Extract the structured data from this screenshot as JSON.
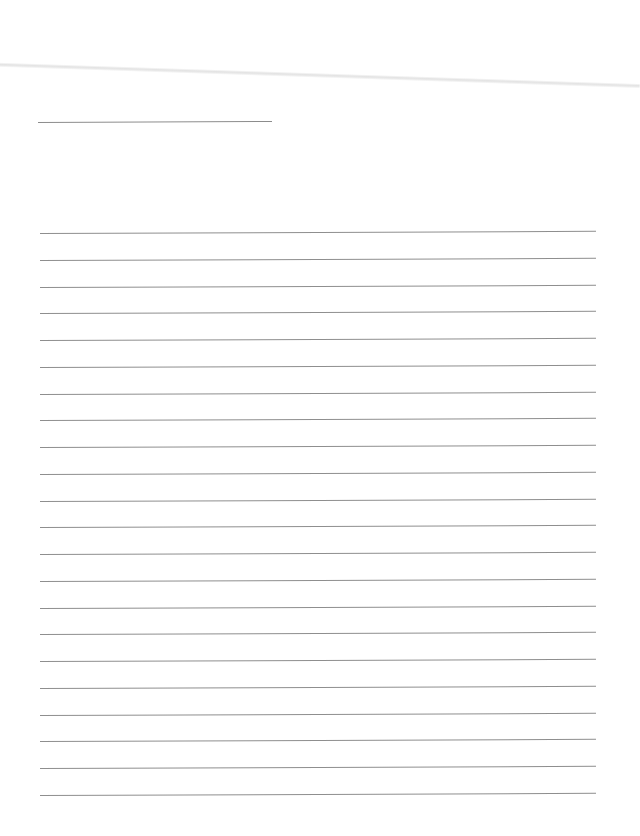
{
  "page": {
    "type": "blank lined writing sheet",
    "background_color": "#ffffff",
    "line_color": "#8e8e8e",
    "title_line": {
      "label": "",
      "value": ""
    },
    "ruled_lines": [
      {
        "text": ""
      },
      {
        "text": ""
      },
      {
        "text": ""
      },
      {
        "text": ""
      },
      {
        "text": ""
      },
      {
        "text": ""
      },
      {
        "text": ""
      },
      {
        "text": ""
      },
      {
        "text": ""
      },
      {
        "text": ""
      },
      {
        "text": ""
      },
      {
        "text": ""
      },
      {
        "text": ""
      },
      {
        "text": ""
      },
      {
        "text": ""
      },
      {
        "text": ""
      },
      {
        "text": ""
      },
      {
        "text": ""
      },
      {
        "text": ""
      },
      {
        "text": ""
      },
      {
        "text": ""
      },
      {
        "text": ""
      }
    ]
  }
}
